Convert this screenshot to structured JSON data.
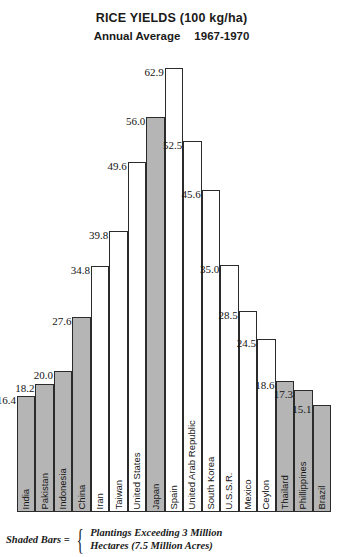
{
  "title": {
    "main": "RICE YIELDS (100 kg/ha)",
    "sub_left": "Annual Average",
    "sub_right": "1967-1970"
  },
  "legend": {
    "key_label": "Shaded Bars =",
    "line1": "Plantings Exceeding 3 Million",
    "line2": "Hectares (7.5 Million Acres)",
    "shaded_color": "#b5b5b5",
    "unshaded_color": "#ffffff",
    "outline_color": "#2b2b2b"
  },
  "chart_data": {
    "type": "bar",
    "title": "RICE YIELDS (100 kg/ha)",
    "subtitle": "Annual Average   1967-1970",
    "xlabel": "",
    "ylabel": "Rice yield (100 kg/ha)",
    "ylim": [
      0,
      62.9
    ],
    "grid": false,
    "legend_position": "bottom",
    "categories": [
      "India",
      "Pakistan",
      "Indonesia",
      "China",
      "Iran",
      "Taiwan",
      "United States",
      "Japan",
      "Spain",
      "United Arab Republic",
      "South Korea",
      "U.S.S.R.",
      "Mexico",
      "Ceylon",
      "Thailard",
      "Phillippines",
      "Brazil"
    ],
    "values": [
      16.4,
      18.2,
      20.0,
      27.6,
      34.8,
      39.8,
      49.6,
      56.0,
      62.9,
      52.5,
      45.6,
      35.0,
      28.5,
      24.5,
      18.6,
      17.3,
      15.1
    ],
    "value_labels": [
      "16.4",
      "18.2",
      "20.0",
      "27.6",
      "34.8",
      "39.8",
      "49.6",
      "56.0",
      "62.9",
      "52.5",
      "45.6",
      "35.0",
      "28.5",
      "24.5",
      "18.6",
      "17.3",
      "15.1"
    ],
    "shaded": [
      true,
      true,
      true,
      true,
      false,
      false,
      false,
      true,
      false,
      false,
      false,
      false,
      false,
      false,
      true,
      true,
      true
    ],
    "series": [
      {
        "name": "Rice yield (100 kg/ha)",
        "values": [
          16.4,
          18.2,
          20.0,
          27.6,
          34.8,
          39.8,
          49.6,
          56.0,
          62.9,
          52.5,
          45.6,
          35.0,
          28.5,
          24.5,
          18.6,
          17.3,
          15.1
        ]
      }
    ],
    "annotations": [
      "Shaded Bars = Plantings Exceeding 3 Million Hectares (7.5 Million Acres)"
    ]
  }
}
